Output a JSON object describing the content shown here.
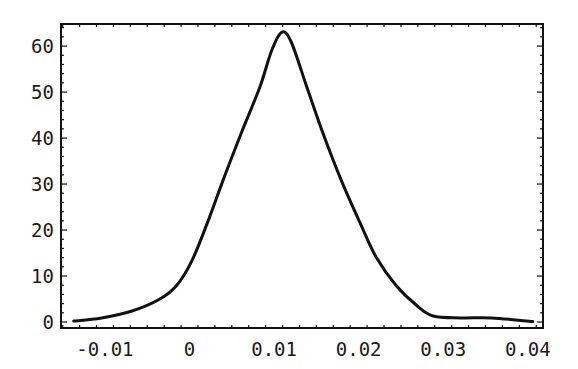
{
  "chart_data": {
    "type": "line",
    "title": "",
    "xlabel": "",
    "ylabel": "",
    "xlim": [
      -0.0152,
      0.0418
    ],
    "ylim": [
      -1.3,
      64.8
    ],
    "grid": false,
    "legend": null,
    "frame": true,
    "x_ticks": [
      -0.01,
      0,
      0.01,
      0.02,
      0.03,
      0.04
    ],
    "x_tick_labels": [
      "-0.01",
      "0",
      "0.01",
      "0.02",
      "0.03",
      "0.04"
    ],
    "y_ticks": [
      0,
      10,
      20,
      30,
      40,
      50,
      60
    ],
    "y_tick_labels": [
      "0",
      "10",
      "20",
      "30",
      "40",
      "50",
      "60"
    ],
    "series": [
      {
        "name": "density",
        "color": "#111111",
        "x": [
          -0.0137,
          -0.0104,
          -0.0068,
          -0.0035,
          -0.0015,
          0.0002,
          0.002,
          0.004,
          0.0061,
          0.0083,
          0.0097,
          0.0109,
          0.012,
          0.0138,
          0.0156,
          0.0179,
          0.0203,
          0.0221,
          0.0244,
          0.0268,
          0.0288,
          0.0321,
          0.0357,
          0.0406
        ],
        "y": [
          0.2,
          0.9,
          2.4,
          5.0,
          8.0,
          13,
          21,
          31,
          41,
          51,
          59,
          63,
          61,
          51.5,
          42,
          31,
          21,
          14,
          8,
          3.7,
          1.3,
          0.9,
          0.9,
          0.1
        ]
      }
    ]
  }
}
